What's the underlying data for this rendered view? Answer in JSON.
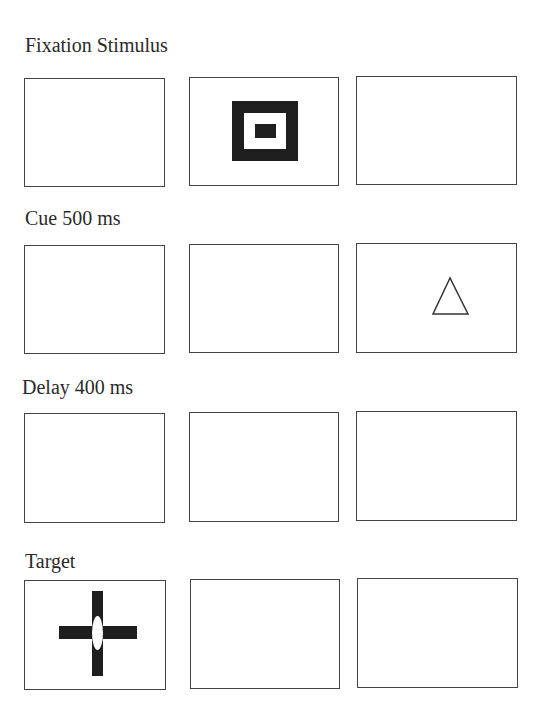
{
  "figure": {
    "rows": [
      {
        "label": "Fixation Stimulus",
        "stimulus_panel": 2,
        "stimulus": "concentric-squares-icon"
      },
      {
        "label": "Cue 500 ms",
        "stimulus_panel": 3,
        "stimulus": "triangle-outline-icon"
      },
      {
        "label": "Delay 400 ms",
        "stimulus_panel": null,
        "stimulus": null
      },
      {
        "label": "Target",
        "stimulus_panel": 1,
        "stimulus": "cross-with-ellipse-icon"
      }
    ],
    "colors": {
      "frame": "#444444",
      "fill": "#1e1e1e",
      "background": "#ffffff"
    }
  }
}
